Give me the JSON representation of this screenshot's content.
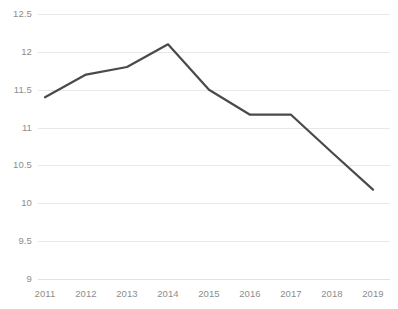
{
  "chart_data": {
    "type": "line",
    "title": "",
    "subtitle": "",
    "xlabel": "",
    "ylabel": "",
    "categories": [
      "2011",
      "2012",
      "2013",
      "2014",
      "2015",
      "2016",
      "2017",
      "2018",
      "2019"
    ],
    "x": [
      2011,
      2012,
      2013,
      2014,
      2015,
      2016,
      2017,
      2018,
      2019
    ],
    "values": [
      11.4,
      11.7,
      11.8,
      12.1,
      11.5,
      11.17,
      11.17,
      10.67,
      10.18
    ],
    "series": [
      {
        "name": "",
        "values": [
          11.4,
          11.7,
          11.8,
          12.1,
          11.5,
          11.17,
          11.17,
          10.67,
          10.18
        ]
      }
    ],
    "ylim": [
      9,
      12.5
    ],
    "xlim": [
      2011,
      2019
    ],
    "ytick_labels": [
      "9",
      "9.5",
      "10",
      "10.5",
      "11",
      "11.5",
      "12",
      "12.5"
    ],
    "ytick_values": [
      9,
      9.5,
      10,
      10.5,
      11,
      11.5,
      12,
      12.5
    ],
    "xtick_labels": [
      "2011",
      "2012",
      "2013",
      "2014",
      "2015",
      "2016",
      "2017",
      "2018",
      "2019"
    ],
    "grid": true,
    "grid_axis": "y",
    "legend": false,
    "legend_position": "none",
    "markers": false,
    "annotations": [],
    "colors": {
      "line": "#4a4a4a",
      "gridline": "#e8e8e8",
      "tick_label": "#8d8d8d",
      "background": "#ffffff"
    },
    "line_width": 2.2
  }
}
